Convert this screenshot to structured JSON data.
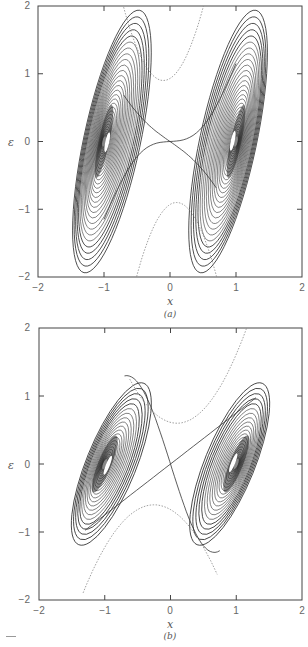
{
  "chart_data": [
    {
      "type": "contour",
      "panel_label": "(a)",
      "xlabel": "x",
      "ylabel": "ε",
      "xlim": [
        -2,
        2
      ],
      "ylim": [
        -2,
        2
      ],
      "xticks": [
        "−2",
        "−1",
        "0",
        "1",
        "2"
      ],
      "yticks": [
        "2",
        "1",
        "0",
        "−1",
        "−2"
      ],
      "grid": false,
      "description": "Phase-space contours of a double-well system; two families of nested closed orbits centered near (−1, 0) and (1, 0), separated by an X-shaped separatrix crossing at the origin; dotted outer contour near ε = ±0.9 at x ≈ ±0.2",
      "centers": [
        [
          -1,
          0
        ],
        [
          1,
          0
        ]
      ],
      "separatrix_crossing": [
        0,
        0
      ],
      "outer_dotted_min_abs_eps": 0.9
    },
    {
      "type": "contour",
      "panel_label": "(b)",
      "xlabel": "x",
      "ylabel": "ε",
      "xlim": [
        -2,
        2
      ],
      "ylim": [
        -2,
        2
      ],
      "xticks": [
        "−2",
        "−1",
        "0",
        "1",
        "2"
      ],
      "yticks": [
        "2",
        "1",
        "0",
        "−1",
        "−2"
      ],
      "grid": false,
      "description": "Same double-well contours with stronger coupling: orbit families centered near (−1, 0) and (1, 0) are more tilted and compact; separatrix crosses at origin; outer contour spans ε ≈ −1.5 to 1.5",
      "centers": [
        [
          -1,
          0
        ],
        [
          1,
          0
        ]
      ],
      "separatrix_crossing": [
        0,
        0
      ],
      "outer_extent_eps": [
        -1.5,
        1.5
      ]
    }
  ],
  "panels": [
    {
      "caption": "(a)",
      "xlabel": "x",
      "ylabel": "ε",
      "yticks": [
        "2",
        "1",
        "0",
        "−1",
        "−2"
      ],
      "xticks": [
        "−2",
        "−1",
        "0",
        "1",
        "2"
      ]
    },
    {
      "caption": "(b)",
      "xlabel": "x",
      "ylabel": "ε",
      "yticks": [
        "2",
        "1",
        "0",
        "−1",
        "−2"
      ],
      "xticks": [
        "−2",
        "−1",
        "0",
        "1",
        "2"
      ]
    }
  ]
}
